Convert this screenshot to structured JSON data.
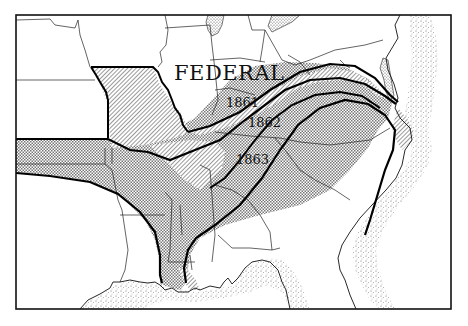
{
  "map": {
    "title_label": "FEDERAL",
    "year_labels": [
      "1861",
      "1862",
      "1863"
    ],
    "colors": {
      "ink": "#1a1a1a",
      "paper": "#ffffff",
      "water_stipple": "#555555"
    },
    "legend_meaning": {
      "hatched": "Confederate territory lost by 1862",
      "crosshatched": "Confederate territory lost by 1863"
    }
  }
}
